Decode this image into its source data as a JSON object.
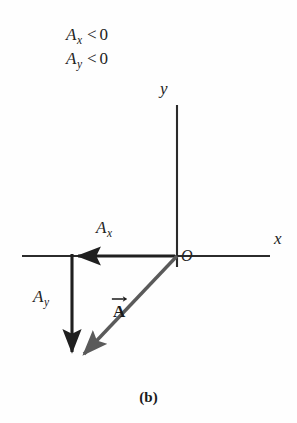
{
  "figure": {
    "caption": "(b)",
    "background_color": "#fefefe",
    "ink_color": "#2b2b2b"
  },
  "conditions": [
    {
      "symbol": "A",
      "subscript": "x",
      "relation": "<",
      "value": "0"
    },
    {
      "symbol": "A",
      "subscript": "y",
      "relation": "<",
      "value": "0"
    }
  ],
  "axes": {
    "x_label": "x",
    "y_label": "y",
    "origin_label": "O",
    "x_axis": {
      "x1": 22,
      "y1": 256,
      "x2": 270,
      "y2": 256
    },
    "y_axis": {
      "x1": 177,
      "y1": 105,
      "x2": 177,
      "y2": 267
    }
  },
  "vectors": {
    "x_component": {
      "label": "A",
      "subscript": "x",
      "direction": "negative-x",
      "color": "#1f1f1f",
      "from": {
        "x": 177,
        "y": 256
      },
      "to": {
        "x": 74,
        "y": 256
      }
    },
    "y_component": {
      "label": "A",
      "subscript": "y",
      "direction": "negative-y",
      "color": "#1f1f1f",
      "from": {
        "x": 72,
        "y": 256
      },
      "to": {
        "x": 72,
        "y": 358
      }
    },
    "resultant": {
      "label": "A",
      "notation": "bold-with-overarrow",
      "color": "#575757",
      "from": {
        "x": 177,
        "y": 256
      },
      "to": {
        "x": 78,
        "y": 360
      }
    }
  }
}
